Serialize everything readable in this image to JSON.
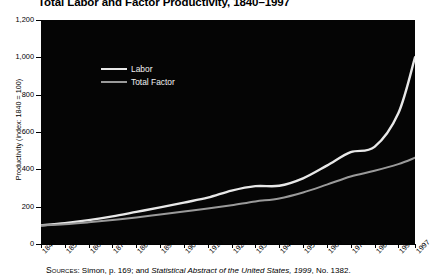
{
  "chart_data": {
    "type": "line",
    "title": "Total Labor and Factor Productivity, 1840–1997",
    "xlabel": "",
    "ylabel": "Productivity (index: 1840 = 100)",
    "ylim": [
      0,
      1200
    ],
    "xlim": [
      1840,
      1997
    ],
    "grid": false,
    "legend_position": "upper-left-inside",
    "plot_background": "#050505",
    "x_tick_labels": [
      "1840",
      "1850",
      "1860",
      "1870",
      "1880",
      "1890",
      "1900",
      "1910",
      "1920",
      "1930",
      "1940",
      "1950",
      "1960",
      "1970",
      "1980",
      "1990",
      "1997"
    ],
    "x_tick_values": [
      1840,
      1850,
      1860,
      1870,
      1880,
      1890,
      1900,
      1910,
      1920,
      1930,
      1940,
      1950,
      1960,
      1970,
      1980,
      1990,
      1997
    ],
    "y_tick_labels": [
      "0",
      "200",
      "400",
      "600",
      "800",
      "1,000",
      "1,200"
    ],
    "y_tick_values": [
      0,
      200,
      400,
      600,
      800,
      1000,
      1200
    ],
    "series": [
      {
        "name": "Labor",
        "color": "#e8e8e8",
        "x": [
          1840,
          1850,
          1860,
          1870,
          1880,
          1890,
          1900,
          1910,
          1920,
          1930,
          1940,
          1950,
          1960,
          1970,
          1980,
          1990,
          1997
        ],
        "values": [
          100,
          112,
          128,
          148,
          172,
          196,
          222,
          248,
          286,
          310,
          312,
          352,
          420,
          492,
          520,
          700,
          1000
        ]
      },
      {
        "name": "Total Factor",
        "color": "#9a9a9a",
        "x": [
          1840,
          1850,
          1860,
          1870,
          1880,
          1890,
          1900,
          1910,
          1920,
          1930,
          1940,
          1950,
          1960,
          1970,
          1980,
          1990,
          1997
        ],
        "values": [
          100,
          106,
          116,
          128,
          142,
          158,
          174,
          190,
          208,
          228,
          244,
          276,
          318,
          362,
          392,
          428,
          462
        ]
      }
    ]
  },
  "legend": {
    "items": [
      {
        "label": "Labor",
        "color": "#e8e8e8"
      },
      {
        "label": "Total Factor",
        "color": "#9a9a9a"
      }
    ]
  },
  "source": {
    "prefix": "Sources",
    "text_before_italic": ": Simon, p. 169; and ",
    "italic_text": "Statistical Abstract of the United States, 1999",
    "text_after_italic": ", No. 1382."
  }
}
